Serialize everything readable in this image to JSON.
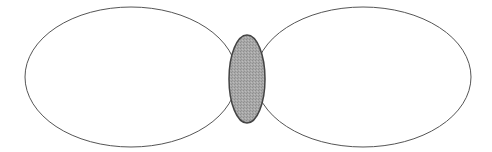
{
  "diagram": {
    "canvas": {
      "width": 492,
      "height": 152,
      "background": "#ffffff"
    },
    "shapes": {
      "left_lobe": {
        "cx": 131,
        "cy": 77,
        "rx": 106,
        "ry": 70,
        "fill": "#ffffff",
        "stroke": "#555555",
        "stroke_width": 1
      },
      "right_lobe": {
        "cx": 363,
        "cy": 77,
        "rx": 108,
        "ry": 70,
        "fill": "#ffffff",
        "stroke": "#555555",
        "stroke_width": 1
      },
      "center_overlap": {
        "cx": 247,
        "cy": 79,
        "rx": 18,
        "ry": 44,
        "fill": "#a8a8a8",
        "stroke": "#444444",
        "stroke_width": 1.5
      }
    },
    "colors": {
      "outline": "#555555",
      "center_fill": "#a8a8a8",
      "center_outline": "#444444"
    }
  }
}
